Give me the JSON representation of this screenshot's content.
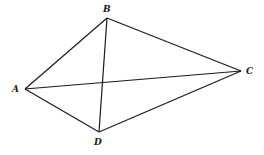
{
  "diagram": {
    "type": "quadrilateral-with-diagonals",
    "points": [
      {
        "id": "A",
        "label": "A",
        "x": 25,
        "y": 89,
        "lx": 12,
        "ly": 92
      },
      {
        "id": "B",
        "label": "B",
        "x": 107,
        "y": 18,
        "lx": 103,
        "ly": 12
      },
      {
        "id": "C",
        "label": "C",
        "x": 241,
        "y": 71,
        "lx": 246,
        "ly": 74
      },
      {
        "id": "D",
        "label": "D",
        "x": 99,
        "y": 132,
        "lx": 94,
        "ly": 145
      }
    ],
    "edges": [
      [
        "A",
        "B"
      ],
      [
        "B",
        "C"
      ],
      [
        "C",
        "D"
      ],
      [
        "D",
        "A"
      ],
      [
        "A",
        "C"
      ],
      [
        "B",
        "D"
      ]
    ],
    "colors": {
      "line": "#1a1a1a",
      "background": "#ffffff"
    }
  }
}
